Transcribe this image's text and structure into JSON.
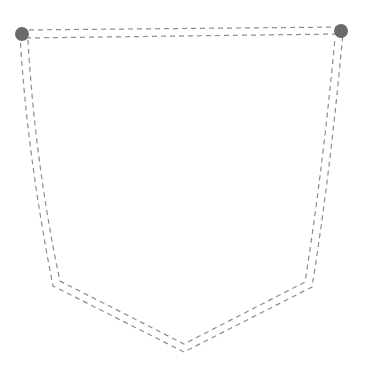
{
  "diagram": {
    "type": "pocket-stitch-outline",
    "stroke_color": "#8c8c8c",
    "dot_color": "#6b6b6b",
    "background": "#ffffff",
    "outer_path": "M 20 34 C 24 110, 36 200, 53 286 L 184 352 L 312 287 C 326 200, 336 110, 343 32",
    "inner_path": "M 28 40 C 32 114, 43 202, 60 281 L 184 344 L 305 282 C 318 200, 328 114, 335 38",
    "top_outer": "M 20 30 L 343 27",
    "top_inner": "M 26 38 L 337 34",
    "dots": [
      {
        "name": "left-corner-dot",
        "cx": 22,
        "cy": 34,
        "r": 7
      },
      {
        "name": "right-corner-dot",
        "cx": 341,
        "cy": 31,
        "r": 7
      }
    ]
  }
}
